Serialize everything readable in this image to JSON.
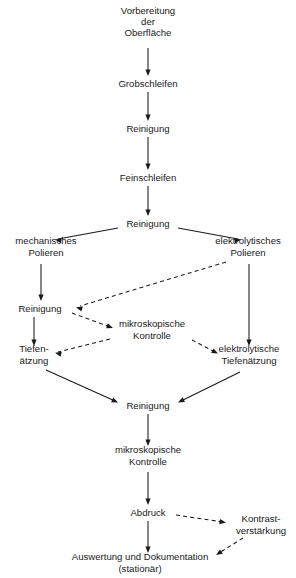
{
  "diagram": {
    "type": "flowchart",
    "orientation": "top-to-bottom",
    "background_color": "#ffffff",
    "text_color": "#1a1a1a",
    "edge_color": "#1a1a1a",
    "nodes": [
      {
        "id": "vorbereitung",
        "lines": [
          "Vorbereitung",
          "der",
          "Oberfläche"
        ],
        "x": 148,
        "y": 22,
        "shape": "text-only"
      },
      {
        "id": "grobschleifen",
        "lines": [
          "Grobschleifen"
        ],
        "x": 148,
        "y": 84,
        "shape": "text-only"
      },
      {
        "id": "reinigung-1",
        "lines": [
          "Reinigung"
        ],
        "x": 148,
        "y": 129,
        "shape": "text-only"
      },
      {
        "id": "feinschleifen",
        "lines": [
          "Feinschleifen"
        ],
        "x": 148,
        "y": 178,
        "shape": "text-only"
      },
      {
        "id": "reinigung-2",
        "lines": [
          "Reinigung"
        ],
        "x": 148,
        "y": 224,
        "shape": "text-only"
      },
      {
        "id": "mechanisches-polieren",
        "lines": [
          "mechanisches",
          "Polieren"
        ],
        "x": 46,
        "y": 247,
        "shape": "text-only"
      },
      {
        "id": "elektrolytisches-polieren",
        "lines": [
          "elektrolytisches",
          "Polieren"
        ],
        "x": 248,
        "y": 247,
        "shape": "text-only"
      },
      {
        "id": "reinigung-3",
        "lines": [
          "Reinigung"
        ],
        "x": 40,
        "y": 309,
        "shape": "text-only"
      },
      {
        "id": "mikroskopische-kontrolle-1",
        "lines": [
          "mikroskopische",
          "Kontrolle"
        ],
        "x": 152,
        "y": 330,
        "shape": "text-only"
      },
      {
        "id": "tiefenaetzung",
        "lines": [
          "Tiefen-",
          "ätzung"
        ],
        "x": 34,
        "y": 355,
        "shape": "text-only"
      },
      {
        "id": "elektrolytische-tiefenaetzung",
        "lines": [
          "elektrolytische",
          "Tiefenätzung"
        ],
        "x": 249,
        "y": 355,
        "shape": "text-only"
      },
      {
        "id": "reinigung-4",
        "lines": [
          "Reinigung"
        ],
        "x": 148,
        "y": 406,
        "shape": "text-only"
      },
      {
        "id": "mikroskopische-kontrolle-2",
        "lines": [
          "mikroskopische",
          "Kontrolle"
        ],
        "x": 148,
        "y": 456,
        "shape": "text-only"
      },
      {
        "id": "abdruck",
        "lines": [
          "Abdruck"
        ],
        "x": 148,
        "y": 513,
        "shape": "text-only"
      },
      {
        "id": "kontrastverstaerkung",
        "lines": [
          "Kontrast-",
          "verstärkung"
        ],
        "x": 261,
        "y": 525,
        "shape": "text-only"
      },
      {
        "id": "auswertung",
        "lines": [
          "Auswertung und Dokumentation",
          "(stationär)"
        ],
        "x": 140,
        "y": 563,
        "shape": "text-only"
      }
    ],
    "edges": [
      {
        "id": "e-vorbereitung-grobschleifen",
        "from": "vorbereitung",
        "to": "grobschleifen",
        "style": "solid",
        "path": "M 148 48 L 148 74",
        "arrow": {
          "x": 148,
          "y": 76,
          "angle": 90
        }
      },
      {
        "id": "e-grobschleifen-reinigung1",
        "from": "grobschleifen",
        "to": "reinigung-1",
        "style": "solid",
        "path": "M 148 92 L 148 119",
        "arrow": {
          "x": 148,
          "y": 121,
          "angle": 90
        }
      },
      {
        "id": "e-reinigung1-feinschleifen",
        "from": "reinigung-1",
        "to": "feinschleifen",
        "style": "solid",
        "path": "M 148 137 L 148 168",
        "arrow": {
          "x": 148,
          "y": 170,
          "angle": 90
        }
      },
      {
        "id": "e-feinschleifen-reinigung2",
        "from": "feinschleifen",
        "to": "reinigung-2",
        "style": "solid",
        "path": "M 148 186 L 148 214",
        "arrow": {
          "x": 148,
          "y": 216,
          "angle": 90
        }
      },
      {
        "id": "e-reinigung2-mechanisches",
        "from": "reinigung-2",
        "to": "mechanisches-polieren",
        "style": "solid",
        "path": "M 118 228 L 58 239",
        "arrow": {
          "x": 55,
          "y": 239.6,
          "angle": 190
        }
      },
      {
        "id": "e-reinigung2-elektrolytisches",
        "from": "reinigung-2",
        "to": "elektrolytisches-polieren",
        "style": "solid",
        "path": "M 178 228 L 238 239",
        "arrow": {
          "x": 241,
          "y": 239.6,
          "angle": 350
        }
      },
      {
        "id": "e-mechanisches-reinigung3",
        "from": "mechanisches-polieren",
        "to": "reinigung-3",
        "style": "solid",
        "path": "M 41 264 L 41 299",
        "arrow": {
          "x": 41,
          "y": 301,
          "angle": 90
        }
      },
      {
        "id": "e-elektrolytisches-tiefenaetzung",
        "from": "elektrolytisches-polieren",
        "to": "elektrolytische-tiefenaetzung",
        "style": "solid",
        "path": "M 249 264 L 249 344",
        "arrow": {
          "x": 249,
          "y": 346,
          "angle": 90
        }
      },
      {
        "id": "e-elektrolytischespolieren-reinigung3",
        "from": "elektrolytisches-polieren",
        "to": "reinigung-3",
        "style": "dashed",
        "path": "M 226 262 L 80 306",
        "arrow": {
          "x": 76,
          "y": 307.2,
          "angle": 197
        }
      },
      {
        "id": "e-reinigung3-mikrokontrolle1",
        "from": "reinigung-3",
        "to": "mikroskopische-kontrolle-1",
        "style": "dashed",
        "path": "M 72 313 L 110 327",
        "arrow": {
          "x": 113,
          "y": 328,
          "angle": 20
        }
      },
      {
        "id": "e-mikrokontrolle1-tiefenaetzung",
        "from": "mikroskopische-kontrolle-1",
        "to": "tiefenaetzung",
        "style": "dashed",
        "path": "M 110 339 L 58 352",
        "arrow": {
          "x": 55,
          "y": 352.8,
          "angle": 194
        }
      },
      {
        "id": "e-mikrokontrolle1-elektrolytische",
        "from": "mikroskopische-kontrolle-1",
        "to": "elektrolytische-tiefenaetzung",
        "style": "dashed",
        "path": "M 192 340 L 215 352",
        "arrow": {
          "x": 218,
          "y": 353.6,
          "angle": 27
        }
      },
      {
        "id": "e-reinigung3-tiefenaetzung",
        "from": "reinigung-3",
        "to": "tiefenaetzung",
        "style": "solid",
        "path": "M 34 317 L 34 344",
        "arrow": {
          "x": 34,
          "y": 346,
          "angle": 90
        }
      },
      {
        "id": "e-tiefenaetzung-reinigung4",
        "from": "tiefenaetzung",
        "to": "reinigung-4",
        "style": "solid",
        "path": "M 46 370 L 115 401",
        "arrow": {
          "x": 118,
          "y": 402.4,
          "angle": 24
        }
      },
      {
        "id": "e-elektrolytische-reinigung4",
        "from": "elektrolytische-tiefenaetzung",
        "to": "reinigung-4",
        "style": "solid",
        "path": "M 240 372 L 181 401",
        "arrow": {
          "x": 178,
          "y": 402.5,
          "angle": 154
        }
      },
      {
        "id": "e-reinigung4-mikrokontrolle2",
        "from": "reinigung-4",
        "to": "mikroskopische-kontrolle-2",
        "style": "solid",
        "path": "M 148 414 L 148 444",
        "arrow": {
          "x": 148,
          "y": 446,
          "angle": 90
        }
      },
      {
        "id": "e-mikrokontrolle2-abdruck",
        "from": "mikroskopische-kontrolle-2",
        "to": "abdruck",
        "style": "solid",
        "path": "M 148 472 L 148 503",
        "arrow": {
          "x": 148,
          "y": 505,
          "angle": 90
        }
      },
      {
        "id": "e-abdruck-kontrastverstaerkung",
        "from": "abdruck",
        "to": "kontrastverstaerkung",
        "style": "dashed",
        "path": "M 176 515 L 223 522",
        "arrow": {
          "x": 226,
          "y": 522.5,
          "angle": 8
        }
      },
      {
        "id": "e-kontrastverstaerkung-auswertung",
        "from": "kontrastverstaerkung",
        "to": "auswertung",
        "style": "dashed",
        "path": "M 243 538 L 219 553",
        "arrow": {
          "x": 216,
          "y": 555,
          "angle": 148
        }
      },
      {
        "id": "e-abdruck-auswertung",
        "from": "abdruck",
        "to": "auswertung",
        "style": "solid",
        "path": "M 148 521 L 148 551",
        "arrow": {
          "x": 148,
          "y": 553,
          "angle": 90
        }
      }
    ]
  }
}
